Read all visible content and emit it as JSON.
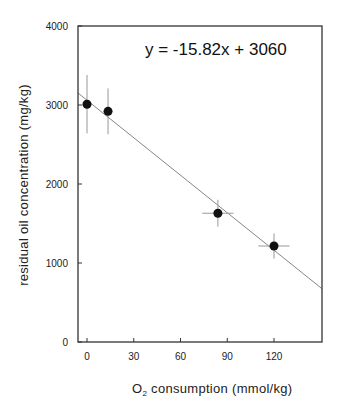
{
  "chart_data": {
    "type": "scatter",
    "title": "",
    "annotation": "y = -15.82x + 3060",
    "xlabel_main": "O",
    "xlabel_sub": "2",
    "xlabel_rest": " consumption (mmol/kg)",
    "xlabel": "O2 consumption (mmol/kg)",
    "ylabel": "residual oil concentration (mg/kg)",
    "xlim": [
      -6,
      150
    ],
    "ylim": [
      0,
      4000
    ],
    "xticks": [
      0,
      30,
      60,
      90,
      120
    ],
    "yticks": [
      0,
      1000,
      2000,
      3000,
      4000
    ],
    "grid": false,
    "legend": null,
    "series": [
      {
        "name": "measurements",
        "x": [
          0,
          13.5,
          84,
          120
        ],
        "y": [
          3010,
          2920,
          1630,
          1215
        ],
        "x_err": [
          0,
          0,
          10,
          10
        ],
        "y_err": [
          370,
          290,
          170,
          160
        ]
      }
    ],
    "fit": {
      "slope": -15.82,
      "intercept": 3060,
      "x_range": [
        -6,
        150
      ]
    }
  },
  "colors": {
    "axis": "#333333",
    "marker": "#111111",
    "errorbar": "#999999",
    "fit_line": "#777777"
  }
}
